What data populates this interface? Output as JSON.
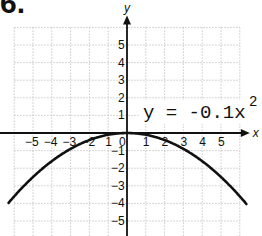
{
  "problem": {
    "number": "6."
  },
  "chart_data": {
    "type": "line",
    "title": "",
    "equation": "y = -0.1x²",
    "equation_text": {
      "lhs": "y = -0.1x",
      "exponent": "2"
    },
    "xlabel": "x",
    "ylabel": "y",
    "xlim": [
      -6,
      6
    ],
    "ylim": [
      -5.5,
      6
    ],
    "grid": true,
    "x_ticks": [
      "-5",
      "-4",
      "-3",
      "-2",
      "-1",
      "0",
      "1",
      "2",
      "3",
      "4",
      "5"
    ],
    "y_ticks": [
      "5",
      "4",
      "3",
      "2",
      "1",
      "-1",
      "-2",
      "-3",
      "-4",
      "-5"
    ],
    "series": [
      {
        "name": "y = -0.1x^2",
        "x": [
          -6,
          -5,
          -4,
          -3,
          -2,
          -1,
          0,
          1,
          2,
          3,
          4,
          5,
          6
        ],
        "y": [
          -3.6,
          -2.5,
          -1.6,
          -0.9,
          -0.4,
          -0.1,
          0,
          -0.1,
          -0.4,
          -0.9,
          -1.6,
          -2.5,
          -3.6
        ]
      }
    ]
  },
  "labels": {
    "x_axis": "x",
    "y_axis": "y",
    "x_ticks": [
      "−5",
      "−4",
      "−3",
      "−2",
      "1",
      "0",
      "1",
      "2",
      "3",
      "4",
      "5"
    ],
    "y_ticks_pos": [
      "5",
      "4",
      "3",
      "2",
      "1"
    ],
    "y_ticks_neg": [
      "−1",
      "−2",
      "−3",
      "−4",
      "−5"
    ]
  }
}
